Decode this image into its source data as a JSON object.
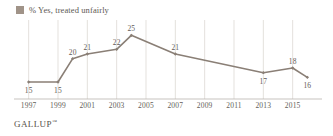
{
  "legend": {
    "label": "% Yes, treated unfairly",
    "swatch_color": "#a09388"
  },
  "footer": {
    "brand": "GALLUP",
    "trademark": "™"
  },
  "chart_data": {
    "type": "line",
    "title": "",
    "subtitle": "",
    "xlabel": "",
    "ylabel": "",
    "grid": "vertical",
    "legend_position": "top-left",
    "line_color": "#8a7f76",
    "marker": "diamond",
    "series": [
      {
        "name": "% Yes, treated unfairly",
        "x": [
          1997,
          1999,
          2000,
          2001,
          2003,
          2004,
          2007,
          2013,
          2015,
          2016
        ],
        "values": [
          15,
          15,
          20,
          21,
          22,
          25,
          21,
          17,
          18,
          16
        ],
        "point_label_positions": [
          "below",
          "below",
          "above",
          "above",
          "above",
          "above",
          "above",
          "below",
          "above",
          "below"
        ]
      }
    ],
    "x_ticks": [
      1997,
      1999,
      2001,
      2003,
      2005,
      2007,
      2009,
      2011,
      2013,
      2015
    ],
    "x_tick_labels": [
      "1997",
      "1999",
      "2001",
      "2003",
      "2005",
      "2007",
      "2009",
      "2011",
      "2013",
      "2015"
    ],
    "xlim": [
      1996,
      2017
    ],
    "ylim": [
      12,
      27
    ],
    "data_labels": [
      "15",
      "15",
      "20",
      "21",
      "22",
      "25",
      "21",
      "17",
      "18",
      "16"
    ]
  }
}
